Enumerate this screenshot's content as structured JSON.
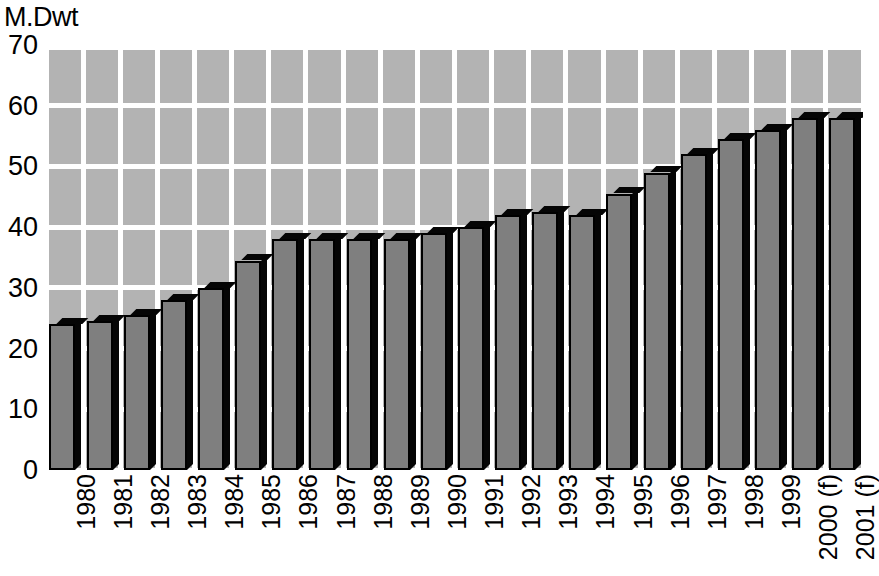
{
  "chart_data": {
    "type": "bar",
    "title": "",
    "subtitle": "",
    "xlabel": "",
    "ylabel": "M.Dwt",
    "ylim": [
      0,
      70
    ],
    "y_ticks": [
      0,
      10,
      20,
      30,
      40,
      50,
      60,
      70
    ],
    "grid": true,
    "legend": "none",
    "style": "3d-bars-on-checkerboard-grid",
    "colors": {
      "bar_face": "#7f7f7f",
      "bar_shadow": "#050505",
      "plot_background": "#b3b3b3",
      "gridline": "#ffffff",
      "text": "#000000",
      "page_background": "#ffffff"
    },
    "categories": [
      "1980",
      "1981",
      "1982",
      "1983",
      "1984",
      "1985",
      "1986",
      "1987",
      "1988",
      "1989",
      "1990",
      "1991",
      "1992",
      "1993",
      "1994",
      "1995",
      "1996",
      "1997",
      "1998",
      "1999",
      "2000 (f)",
      "2001 (f)"
    ],
    "values": [
      24.0,
      24.5,
      25.5,
      28.0,
      30.0,
      34.5,
      38.0,
      38.0,
      38.0,
      38.0,
      39.0,
      40.0,
      42.0,
      42.5,
      42.0,
      45.5,
      49.0,
      52.0,
      54.5,
      56.0,
      58.0,
      58.0
    ],
    "forecast_flags": [
      false,
      false,
      false,
      false,
      false,
      false,
      false,
      false,
      false,
      false,
      false,
      false,
      false,
      false,
      false,
      false,
      false,
      false,
      false,
      false,
      true,
      true
    ]
  }
}
